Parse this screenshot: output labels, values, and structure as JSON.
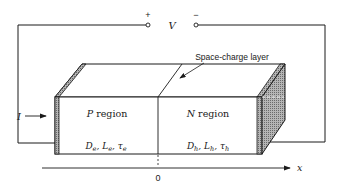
{
  "diagram": {
    "voltage": {
      "label": "V",
      "plus_sign": "+",
      "minus_sign": "−"
    },
    "current": {
      "label": "I"
    },
    "space_charge_label": "Space-charge layer",
    "regions": [
      {
        "name": "P",
        "label_letter": "P",
        "label_word": " region",
        "params": {
          "D": "D",
          "D_sub": "e",
          "L": "L",
          "L_sub": "e",
          "tau": "τ",
          "tau_sub": "e"
        }
      },
      {
        "name": "N",
        "label_letter": "N",
        "label_word": " region",
        "params": {
          "D": "D",
          "D_sub": "h",
          "L": "L",
          "L_sub": "h",
          "tau": "τ",
          "tau_sub": "h"
        }
      }
    ],
    "axis": {
      "label": "x",
      "origin_label": "0"
    },
    "colors": {
      "line": "#1a1a1a",
      "electrode_fill": "#8a8a8a",
      "side_shade": "#9a9a9a"
    }
  }
}
